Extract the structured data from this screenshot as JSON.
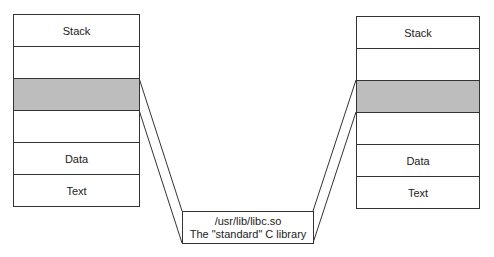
{
  "left_process": {
    "segments": [
      {
        "label": "Stack",
        "shaded": false
      },
      {
        "label": "",
        "shaded": false
      },
      {
        "label": "",
        "shaded": true
      },
      {
        "label": "",
        "shaded": false
      },
      {
        "label": "Data",
        "shaded": false
      },
      {
        "label": "Text",
        "shaded": false
      }
    ]
  },
  "right_process": {
    "segments": [
      {
        "label": "Stack",
        "shaded": false
      },
      {
        "label": "",
        "shaded": false
      },
      {
        "label": "",
        "shaded": true
      },
      {
        "label": "",
        "shaded": false
      },
      {
        "label": "Data",
        "shaded": false
      },
      {
        "label": "Text",
        "shaded": false
      }
    ]
  },
  "shared_library": {
    "path": "/usr/lib/libc.so",
    "description": "The \"standard\" C library"
  },
  "colors": {
    "shaded_segment": "#bdbdbd",
    "border": "#333333"
  }
}
